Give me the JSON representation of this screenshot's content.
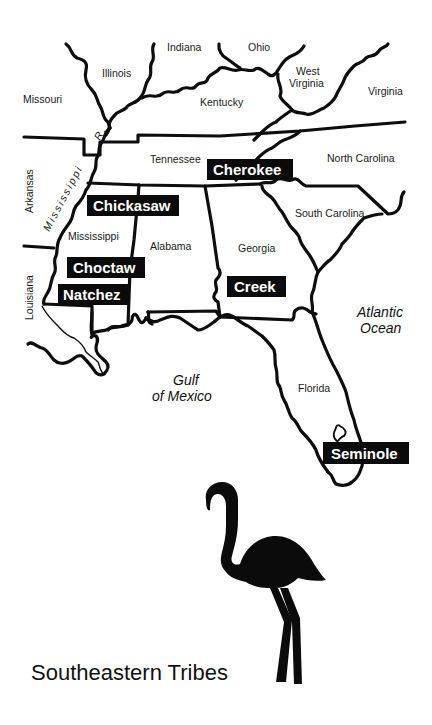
{
  "map": {
    "title": "Southeastern Tribes",
    "states": {
      "indiana": "Indiana",
      "ohio": "Ohio",
      "illinois": "Illinois",
      "west_virginia_1": "West",
      "west_virginia_2": "Virginia",
      "missouri": "Missouri",
      "kentucky": "Kentucky",
      "virginia": "Virginia",
      "tennessee": "Tennessee",
      "north_carolina": "North Carolina",
      "arkansas": "Arkansas",
      "mississippi": "Mississippi",
      "alabama": "Alabama",
      "georgia": "Georgia",
      "south_carolina": "South Carolina",
      "louisiana": "Louisiana",
      "florida": "Florida"
    },
    "rivers": {
      "mississippi_r": "Mississippi",
      "r_abbrev": "R."
    },
    "water_bodies": {
      "atlantic_1": "Atlantic",
      "atlantic_2": "Ocean",
      "gulf_1": "Gulf",
      "gulf_2": "of Mexico"
    },
    "tribes": [
      {
        "name": "Cherokee"
      },
      {
        "name": "Chickasaw"
      },
      {
        "name": "Choctaw"
      },
      {
        "name": "Natchez"
      },
      {
        "name": "Creek"
      },
      {
        "name": "Seminole"
      }
    ],
    "colors": {
      "ink": "#0d0d0d",
      "paper": "#ffffff",
      "label_text": "#ffffff"
    },
    "illustration": "flamingo-silhouette"
  }
}
